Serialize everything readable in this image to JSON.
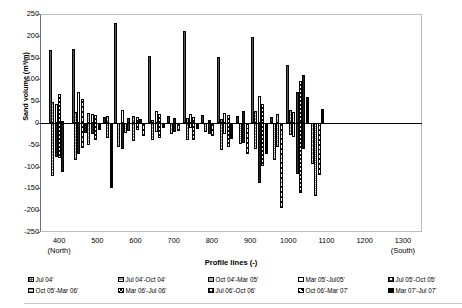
{
  "chart_data": {
    "type": "bar",
    "title": "",
    "xlabel": "Profile lines (-)",
    "ylabel": "Sand volume (m³/m)",
    "ylim": [
      -250,
      250
    ],
    "ytick_step": 50,
    "yticks": [
      250,
      200,
      150,
      100,
      50,
      0,
      -50,
      -100,
      -150,
      -200,
      -250
    ],
    "xticks": [
      400,
      500,
      600,
      700,
      800,
      900,
      1000,
      1100,
      1200,
      1300
    ],
    "xtick_annotations": {
      "400": "(North)",
      "1300": "(South)"
    },
    "xlim": [
      350,
      1350
    ],
    "grid": false,
    "legend_position": "bottom",
    "series": [
      {
        "name": "Jul 04'",
        "pattern": "checker-dark",
        "values": [
          167,
          0,
          0,
          0,
          170,
          0,
          0,
          0,
          230,
          0,
          0,
          0,
          153,
          0,
          0,
          0,
          212,
          0,
          0,
          0,
          152,
          0,
          0,
          0,
          198,
          0,
          0,
          0,
          133,
          0
        ]
      },
      {
        "name": "Jul 04'-Oct 04'",
        "pattern": "hgrid-dark",
        "values": [
          48,
          -122,
          0,
          0,
          26,
          -85,
          0,
          0,
          17,
          -30,
          0,
          0,
          7,
          -40,
          0,
          0,
          12,
          -38,
          0,
          0,
          9,
          -62,
          0,
          0,
          27,
          -60,
          0,
          0,
          30,
          -27
        ]
      },
      {
        "name": "Oct 04'-Mar 05'",
        "pattern": "hgrid-med",
        "values": [
          -60,
          0,
          0,
          0,
          -78,
          0,
          0,
          0,
          -55,
          0,
          0,
          0,
          -28,
          0,
          0,
          0,
          -22,
          0,
          0,
          0,
          -64,
          0,
          0,
          0,
          -55,
          0,
          0,
          0,
          -93,
          -70
        ]
      },
      {
        "name": "Mar 05'-Jul05'",
        "pattern": "open",
        "values": [
          44,
          -78,
          0,
          0,
          72,
          -72,
          0,
          0,
          32,
          -20,
          0,
          0,
          28,
          -14,
          0,
          0,
          21,
          -12,
          0,
          0,
          24,
          -25,
          0,
          0,
          20,
          -38,
          0,
          0,
          25,
          -33
        ]
      },
      {
        "name": "Jul 05'-Oct 05'",
        "pattern": "checker-light",
        "values": [
          25,
          -55,
          0,
          0,
          31,
          -50,
          0,
          0,
          12,
          -22,
          0,
          0,
          15,
          -10,
          0,
          0,
          18,
          -18,
          0,
          0,
          16,
          -30,
          0,
          0,
          13,
          -42,
          0,
          0,
          72,
          -118
        ]
      },
      {
        "name": "Oct 05'-Mar 06'",
        "pattern": "hgrid-fine",
        "values": [
          -110,
          0,
          0,
          0,
          -90,
          0,
          0,
          0,
          -40,
          0,
          0,
          0,
          -25,
          0,
          0,
          0,
          -20,
          0,
          0,
          0,
          -48,
          0,
          0,
          0,
          -86,
          0,
          0,
          0,
          -168,
          -55
        ]
      },
      {
        "name": "Mar 06'-Jul 06'",
        "pattern": "zigzag",
        "values": [
          66,
          -48,
          0,
          0,
          18,
          -32,
          0,
          0,
          14,
          -42,
          0,
          0,
          20,
          -35,
          0,
          0,
          13,
          -40,
          0,
          0,
          18,
          -56,
          0,
          0,
          44,
          -98,
          0,
          0,
          97,
          -160
        ]
      },
      {
        "name": "Jul 06'-Oct 06'",
        "pattern": "checker-dot",
        "values": [
          5,
          -112,
          0,
          0,
          16,
          -60,
          0,
          0,
          9,
          -30,
          0,
          0,
          11,
          -20,
          0,
          0,
          8,
          -26,
          0,
          0,
          28,
          -46,
          0,
          0,
          62,
          -138,
          0,
          0,
          110,
          -60
        ]
      },
      {
        "name": "Oct 06'-Mar 07'",
        "pattern": "diag",
        "values": [
          -34,
          0,
          0,
          0,
          -28,
          0,
          0,
          0,
          -26,
          0,
          0,
          0,
          -18,
          0,
          0,
          0,
          -30,
          0,
          0,
          0,
          -70,
          0,
          0,
          0,
          -196,
          0,
          0,
          0,
          -120,
          -40
        ]
      },
      {
        "name": "Mar 07'-Jul 07'",
        "pattern": "solid-black",
        "values": [
          -20,
          -150,
          0,
          0,
          -16,
          -34,
          0,
          0,
          -12,
          -22,
          0,
          0,
          -10,
          -12,
          0,
          0,
          -14,
          -18,
          0,
          0,
          -36,
          -52,
          0,
          0,
          -72,
          -50,
          0,
          0,
          60,
          33
        ]
      }
    ],
    "bars": [
      {
        "x": 377,
        "v": 167,
        "p": "checker-dark"
      },
      {
        "x": 383,
        "v": 48,
        "p": "hgrid-dark"
      },
      {
        "x": 383,
        "v": -122,
        "p": "hgrid-dark"
      },
      {
        "x": 392,
        "v": 44,
        "p": "open"
      },
      {
        "x": 392,
        "v": -78,
        "p": "checker-dot"
      },
      {
        "x": 400,
        "v": 66,
        "p": "zigzag"
      },
      {
        "x": 400,
        "v": -80,
        "p": "zigzag"
      },
      {
        "x": 410,
        "v": 5,
        "p": "checker-dot"
      },
      {
        "x": 410,
        "v": -112,
        "p": "checker-dot"
      },
      {
        "x": 437,
        "v": 170,
        "p": "checker-dark"
      },
      {
        "x": 443,
        "v": 26,
        "p": "hgrid-dark"
      },
      {
        "x": 443,
        "v": -85,
        "p": "hgrid-dark"
      },
      {
        "x": 452,
        "v": 72,
        "p": "open"
      },
      {
        "x": 452,
        "v": -72,
        "p": "checker-dot"
      },
      {
        "x": 461,
        "v": 55,
        "p": "diag"
      },
      {
        "x": 461,
        "v": -58,
        "p": "diag"
      },
      {
        "x": 470,
        "v": -22,
        "p": "checker-dot"
      },
      {
        "x": 478,
        "v": 22,
        "p": "hgrid-med"
      },
      {
        "x": 478,
        "v": -50,
        "p": "hgrid-med"
      },
      {
        "x": 487,
        "v": 20,
        "p": "open"
      },
      {
        "x": 487,
        "v": -26,
        "p": "checker-light"
      },
      {
        "x": 496,
        "v": 18,
        "p": "zigzag"
      },
      {
        "x": 496,
        "v": -40,
        "p": "zigzag"
      },
      {
        "x": 505,
        "v": -16,
        "p": "solid-black"
      },
      {
        "x": 520,
        "v": 14,
        "p": "checker-light"
      },
      {
        "x": 528,
        "v": 16,
        "p": "hgrid-dark"
      },
      {
        "x": 528,
        "v": -34,
        "p": "hgrid-dark"
      },
      {
        "x": 537,
        "v": -150,
        "p": "solid-black"
      },
      {
        "x": 548,
        "v": 230,
        "p": "checker-dark"
      },
      {
        "x": 556,
        "v": -55,
        "p": "hgrid-med"
      },
      {
        "x": 565,
        "v": 30,
        "p": "open"
      },
      {
        "x": 565,
        "v": -60,
        "p": "checker-dot"
      },
      {
        "x": 574,
        "v": -24,
        "p": "hgrid-fine"
      },
      {
        "x": 582,
        "v": 12,
        "p": "checker-light"
      },
      {
        "x": 582,
        "v": -18,
        "p": "checker-light"
      },
      {
        "x": 596,
        "v": 17,
        "p": "hgrid-dark"
      },
      {
        "x": 596,
        "v": -42,
        "p": "hgrid-dark"
      },
      {
        "x": 605,
        "v": 14,
        "p": "zigzag"
      },
      {
        "x": 605,
        "v": -16,
        "p": "zigzag"
      },
      {
        "x": 614,
        "v": 9,
        "p": "checker-dot"
      },
      {
        "x": 622,
        "v": -30,
        "p": "diag"
      },
      {
        "x": 637,
        "v": 153,
        "p": "checker-dark"
      },
      {
        "x": 645,
        "v": 7,
        "p": "hgrid-dark"
      },
      {
        "x": 645,
        "v": -40,
        "p": "hgrid-dark"
      },
      {
        "x": 654,
        "v": 28,
        "p": "open"
      },
      {
        "x": 654,
        "v": -20,
        "p": "open"
      },
      {
        "x": 663,
        "v": 20,
        "p": "zigzag"
      },
      {
        "x": 663,
        "v": -35,
        "p": "zigzag"
      },
      {
        "x": 672,
        "v": -12,
        "p": "solid-black"
      },
      {
        "x": 686,
        "v": 15,
        "p": "checker-light"
      },
      {
        "x": 694,
        "v": -25,
        "p": "hgrid-med"
      },
      {
        "x": 703,
        "v": 11,
        "p": "checker-dot"
      },
      {
        "x": 703,
        "v": -20,
        "p": "checker-dot"
      },
      {
        "x": 712,
        "v": -18,
        "p": "diag"
      },
      {
        "x": 727,
        "v": 212,
        "p": "checker-dark"
      },
      {
        "x": 735,
        "v": 12,
        "p": "hgrid-dark"
      },
      {
        "x": 735,
        "v": -38,
        "p": "hgrid-dark"
      },
      {
        "x": 744,
        "v": 21,
        "p": "open"
      },
      {
        "x": 744,
        "v": -12,
        "p": "open"
      },
      {
        "x": 753,
        "v": 13,
        "p": "zigzag"
      },
      {
        "x": 753,
        "v": -40,
        "p": "zigzag"
      },
      {
        "x": 762,
        "v": -14,
        "p": "solid-black"
      },
      {
        "x": 776,
        "v": 18,
        "p": "checker-light"
      },
      {
        "x": 784,
        "v": -20,
        "p": "hgrid-fine"
      },
      {
        "x": 793,
        "v": 8,
        "p": "checker-dot"
      },
      {
        "x": 793,
        "v": -26,
        "p": "checker-dot"
      },
      {
        "x": 802,
        "v": -30,
        "p": "diag"
      },
      {
        "x": 817,
        "v": 152,
        "p": "checker-dark"
      },
      {
        "x": 825,
        "v": 9,
        "p": "hgrid-dark"
      },
      {
        "x": 825,
        "v": -62,
        "p": "hgrid-dark"
      },
      {
        "x": 834,
        "v": 24,
        "p": "open"
      },
      {
        "x": 834,
        "v": -25,
        "p": "open"
      },
      {
        "x": 843,
        "v": 18,
        "p": "zigzag"
      },
      {
        "x": 843,
        "v": -56,
        "p": "zigzag"
      },
      {
        "x": 852,
        "v": -36,
        "p": "solid-black"
      },
      {
        "x": 866,
        "v": 16,
        "p": "checker-light"
      },
      {
        "x": 874,
        "v": -48,
        "p": "hgrid-fine"
      },
      {
        "x": 883,
        "v": 28,
        "p": "checker-dot"
      },
      {
        "x": 883,
        "v": -46,
        "p": "checker-dot"
      },
      {
        "x": 892,
        "v": -70,
        "p": "diag"
      },
      {
        "x": 907,
        "v": 198,
        "p": "checker-dark"
      },
      {
        "x": 915,
        "v": 27,
        "p": "hgrid-dark"
      },
      {
        "x": 915,
        "v": -60,
        "p": "hgrid-dark"
      },
      {
        "x": 924,
        "v": 62,
        "p": "open"
      },
      {
        "x": 924,
        "v": -138,
        "p": "checker-dot"
      },
      {
        "x": 933,
        "v": 44,
        "p": "zigzag"
      },
      {
        "x": 933,
        "v": -98,
        "p": "zigzag"
      },
      {
        "x": 942,
        "v": -72,
        "p": "solid-black"
      },
      {
        "x": 956,
        "v": 13,
        "p": "checker-light"
      },
      {
        "x": 964,
        "v": -86,
        "p": "hgrid-fine"
      },
      {
        "x": 973,
        "v": 20,
        "p": "hgrid-med"
      },
      {
        "x": 973,
        "v": -55,
        "p": "hgrid-med"
      },
      {
        "x": 982,
        "v": -196,
        "p": "diag"
      },
      {
        "x": 997,
        "v": 133,
        "p": "checker-dark"
      },
      {
        "x": 1005,
        "v": 30,
        "p": "hgrid-dark"
      },
      {
        "x": 1005,
        "v": -27,
        "p": "hgrid-dark"
      },
      {
        "x": 1014,
        "v": 25,
        "p": "open"
      },
      {
        "x": 1014,
        "v": -33,
        "p": "open"
      },
      {
        "x": 1023,
        "v": 72,
        "p": "checker-light"
      },
      {
        "x": 1023,
        "v": -118,
        "p": "checker-light"
      },
      {
        "x": 1032,
        "v": 97,
        "p": "zigzag"
      },
      {
        "x": 1032,
        "v": -160,
        "p": "zigzag"
      },
      {
        "x": 1041,
        "v": 110,
        "p": "checker-dot"
      },
      {
        "x": 1041,
        "v": -60,
        "p": "checker-dot"
      },
      {
        "x": 1050,
        "v": 60,
        "p": "solid-black"
      },
      {
        "x": 1064,
        "v": -93,
        "p": "hgrid-med"
      },
      {
        "x": 1072,
        "v": -168,
        "p": "hgrid-fine"
      },
      {
        "x": 1081,
        "v": -120,
        "p": "diag"
      },
      {
        "x": 1090,
        "v": 33,
        "p": "solid-black"
      },
      {
        "x": 1250,
        "v": 0,
        "p": "open"
      }
    ]
  },
  "legend": {
    "row1": [
      {
        "label": "Jul 04'",
        "pattern": "checker-dark"
      },
      {
        "label": "Jul 04'-Oct 04'",
        "pattern": "hgrid-dark"
      },
      {
        "label": "Oct 04'-Mar 05'",
        "pattern": "hgrid-med"
      },
      {
        "label": "Mar 05'-Jul05'",
        "pattern": "open"
      },
      {
        "label": "Jul 05'-Oct 05'",
        "pattern": "checker-light"
      }
    ],
    "row2": [
      {
        "label": "Oct 05'-Mar 06'",
        "pattern": "hgrid-fine"
      },
      {
        "label": "Mar 06'-Jul 06'",
        "pattern": "zigzag"
      },
      {
        "label": "Jul 06'-Oct 06'",
        "pattern": "checker-dot"
      },
      {
        "label": "Oct 06'-Mar 07'",
        "pattern": "diag"
      },
      {
        "label": "Mar 07'-Jul 07'",
        "pattern": "solid-black"
      }
    ]
  },
  "axis": {
    "north": "(North)",
    "south": "(South)"
  }
}
